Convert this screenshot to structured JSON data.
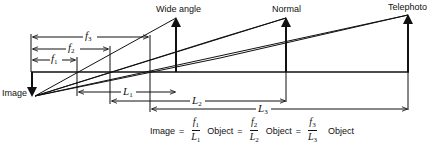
{
  "diagram": {
    "title_labels": {
      "wide_angle": "Wide angle",
      "normal": "Normal",
      "telephoto": "Telephoto",
      "image": "Image"
    },
    "focal_lengths": [
      {
        "symbol": "f",
        "sub": "1"
      },
      {
        "symbol": "f",
        "sub": "2"
      },
      {
        "symbol": "f",
        "sub": "3"
      }
    ],
    "distances": [
      {
        "symbol": "L",
        "sub": "1"
      },
      {
        "symbol": "L",
        "sub": "2"
      },
      {
        "symbol": "L",
        "sub": "3"
      }
    ],
    "equation": {
      "lhs": "Image",
      "equals": "=",
      "object_word": "Object",
      "terms": [
        {
          "num": "f",
          "num_sub": "1",
          "den": "L",
          "den_sub": "1"
        },
        {
          "num": "f",
          "num_sub": "2",
          "den": "L",
          "den_sub": "2"
        },
        {
          "num": "f",
          "num_sub": "3",
          "den": "L",
          "den_sub": "3"
        }
      ]
    },
    "colors": {
      "ink": "#111111",
      "background": "#ffffff"
    }
  }
}
